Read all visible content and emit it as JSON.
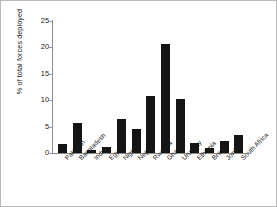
{
  "chart_data": {
    "type": "bar",
    "title": "",
    "subtitle": "",
    "xlabel": "",
    "ylabel": "% of total forces deployed",
    "ylim": [
      0,
      25
    ],
    "yticks": [
      0,
      5,
      10,
      15,
      20,
      25
    ],
    "grid": false,
    "legend": null,
    "bar_color": "#141414",
    "categories": [
      "Pakistan",
      "Bangladesh",
      "India",
      "Egypt",
      "Nigeria",
      "Nepal",
      "Rwanda",
      "Ghana",
      "Uruguay",
      "Ethiopia",
      "Brazil",
      "Jordan",
      "South Africa"
    ],
    "values": [
      1.7,
      5.7,
      0.6,
      1.2,
      6.4,
      4.5,
      10.8,
      20.5,
      10.2,
      1.9,
      0.9,
      2.2,
      3.4
    ]
  },
  "figure": {
    "border_color": "#b9b9b9",
    "background": "#ffffff",
    "axis_color": "#8c8c8c"
  }
}
